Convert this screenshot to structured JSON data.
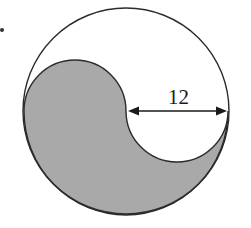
{
  "diagram": {
    "type": "circle-yin-yang-region",
    "outer_circle": {
      "cx": 126,
      "cy": 111,
      "r": 103
    },
    "inner_semicircle_radius": 51,
    "dimension": {
      "label": "12",
      "description": "radius of the small semicircle, double-headed arrow"
    },
    "colors": {
      "shaded": "#a9a9a9",
      "stroke": "#2b2b2b",
      "background": "#ffffff"
    },
    "stray_mark": "dot"
  }
}
